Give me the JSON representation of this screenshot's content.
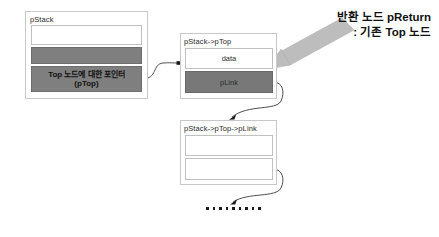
{
  "diagram": {
    "title_hidden": "",
    "nodes": [
      {
        "id": "pstack",
        "label": "pStack",
        "slots": [
          {
            "name": "empty-field",
            "text": "",
            "fill": "white"
          },
          {
            "name": "gray-field",
            "text": "",
            "fill": "gray"
          },
          {
            "name": "ptop-pointer",
            "text_line1": "Top 노드에 대한 포인터",
            "text_line2": "(pTop)",
            "fill": "gray"
          }
        ]
      },
      {
        "id": "ptop",
        "label": "pStack->pTop",
        "slots": [
          {
            "name": "data-field",
            "text": "data",
            "fill": "white"
          },
          {
            "name": "plink-field",
            "text": "pLink",
            "fill": "gray"
          }
        ]
      },
      {
        "id": "plink",
        "label": "pStack->pTop->pLink",
        "slots": [
          {
            "name": "data-field",
            "text": "",
            "fill": "white"
          },
          {
            "name": "plink-field",
            "text": "",
            "fill": "white"
          }
        ]
      }
    ],
    "callout": {
      "line1": "반환 노드 pReturn",
      "line2": ": 기존 Top 노드",
      "arrow": "block-arrow-down-left"
    },
    "ellipsis": {
      "symbol": "•",
      "count": 9
    },
    "colors": {
      "gray_fill": "#7f7f7f",
      "box_border": "#c8c8c8",
      "slot_border": "#c0c0c0",
      "connector": "#3a3a3a",
      "callout_arrow": "#b5b5b5",
      "text": "#2b2b2b",
      "background": "#ffffff"
    }
  }
}
